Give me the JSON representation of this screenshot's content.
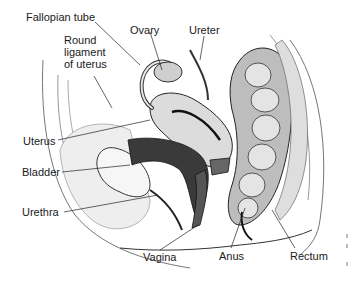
{
  "diagram": {
    "labels": {
      "fallopian_tube": "Fallopian tube",
      "ovary": "Ovary",
      "round_ligament": [
        "Round",
        "ligament",
        "of uterus"
      ],
      "ureter": "Ureter",
      "uterus": "Uterus",
      "bladder": "Bladder",
      "urethra": "Urethra",
      "vagina": "Vagina",
      "anus": "Anus",
      "rectum": "Rectum"
    },
    "colors": {
      "ink": "#1a1a1a",
      "tissue_light": "#e9e9e9",
      "tissue_mid": "#c8c8c8",
      "tissue_dark": "#4a4a4a",
      "background": "#ffffff"
    }
  }
}
